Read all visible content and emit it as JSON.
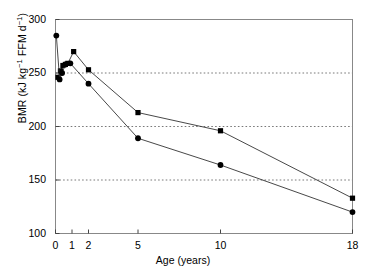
{
  "chart_data": {
    "type": "line",
    "title": "",
    "xlabel": "Age (years)",
    "ylabel": "BMR (kJ kg⁻¹ FFM d⁻¹)",
    "ylabel_parts": {
      "prefix": "BMR (kJ kg",
      "sup1": "−1",
      "middle": " FFM d",
      "sup2": "−1",
      "suffix": ")"
    },
    "xlim": [
      0,
      18
    ],
    "ylim": [
      100,
      300
    ],
    "xticks": [
      0,
      1,
      2,
      5,
      10,
      18
    ],
    "xticklabels": [
      "0",
      "1",
      "2",
      "5",
      "10",
      "18"
    ],
    "yticks": [
      100,
      150,
      200,
      250,
      300
    ],
    "yticklabels": [
      "100",
      "150",
      "200",
      "250",
      "300"
    ],
    "gridlines_y": [
      150,
      200,
      250
    ],
    "grid": "dotted-horizontal",
    "legend": "none",
    "line_color": "#333333",
    "marker_color": "#000000",
    "frame_color": "#888888",
    "series": [
      {
        "name": "upper",
        "marker": "square",
        "x": [
          0.15,
          0.3,
          0.45,
          0.6,
          0.75,
          1.1,
          2.0,
          5.0,
          10.0,
          18.0
        ],
        "values": [
          246,
          252,
          257,
          258,
          259,
          270,
          253,
          213,
          196,
          133
        ]
      },
      {
        "name": "lower",
        "marker": "circle",
        "x": [
          0.05,
          0.25,
          0.4,
          0.6,
          0.9,
          2.0,
          5.0,
          10.0,
          18.0
        ],
        "values": [
          285,
          244,
          250,
          258,
          259,
          240,
          189,
          164,
          120
        ]
      }
    ]
  }
}
